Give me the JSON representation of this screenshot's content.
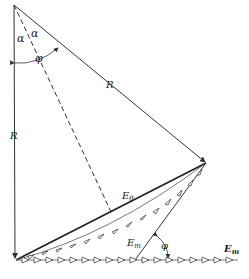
{
  "diagram": {
    "labels": {
      "alpha_left": "α",
      "alpha_right": "α",
      "phi_top": "φ",
      "R_left": "R",
      "R_diag": "R",
      "E_theta": "E",
      "E_theta_sub": "θ",
      "E_m_mid": "E",
      "E_m_mid_sub": "m",
      "E_m_right": "E",
      "E_m_right_sub": "m",
      "phi_bottom": "φ"
    },
    "points": {
      "top": [
        14,
        5
      ],
      "bottom_left": [
        15,
        260
      ],
      "apex": [
        206,
        163
      ],
      "secondary_base": [
        135,
        260
      ],
      "dashed_end": [
        112,
        214
      ],
      "axis_end": [
        238,
        260
      ]
    },
    "colors": {
      "line": "#333333",
      "background": "#ffffff"
    }
  }
}
